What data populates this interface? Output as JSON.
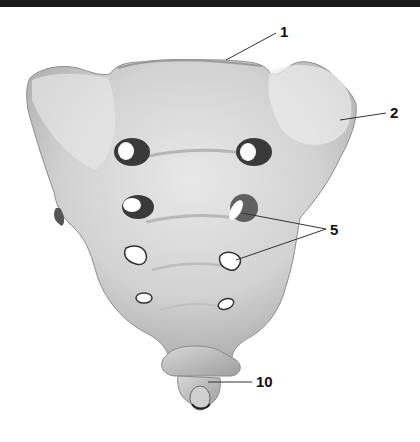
{
  "figure": {
    "background": "#ffffff",
    "bone_color": "#cfcfcf",
    "foramen_color": "#ffffff",
    "shadow_color": "#3a3a3a",
    "leader_line_color": "#333333"
  },
  "labels": [
    {
      "id": "1",
      "text": "1",
      "x": 280,
      "y": 32,
      "points_to": [
        [
          226,
          60
        ]
      ]
    },
    {
      "id": "2",
      "text": "2",
      "x": 392,
      "y": 115,
      "points_to": [
        [
          340,
          120
        ]
      ]
    },
    {
      "id": "5",
      "text": "5",
      "x": 330,
      "y": 233,
      "points_to": [
        [
          242,
          213
        ],
        [
          236,
          260
        ]
      ]
    },
    {
      "id": "10",
      "text": "10",
      "x": 258,
      "y": 382,
      "points_to": [
        [
          208,
          382
        ]
      ]
    }
  ]
}
